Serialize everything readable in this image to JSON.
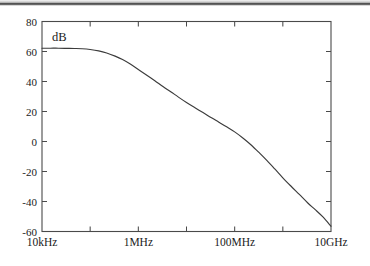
{
  "figure": {
    "background_color": "#ffffff",
    "line_color": "#3b3b3b",
    "axis_color": "#4a4a4a",
    "scan_artifact_label": "scan-band"
  },
  "chart_data": {
    "type": "line",
    "title": "",
    "subtitle": "",
    "xlabel": "",
    "ylabel": "dB",
    "ylabel_position": "inside-top-left",
    "x_scale": "log",
    "y_scale": "linear",
    "grid": false,
    "legend": null,
    "xlim": [
      10000,
      10000000000
    ],
    "ylim": [
      -60,
      80
    ],
    "x_tick_values": [
      10000,
      100000,
      1000000,
      10000000,
      100000000,
      1000000000,
      10000000000
    ],
    "x_tick_labels": [
      "10kHz",
      "",
      "1MHz",
      "",
      "100MHz",
      "",
      "10GHz"
    ],
    "x_major_labels": [
      {
        "value": 10000,
        "label": "10kHz"
      },
      {
        "value": 1000000,
        "label": "1MHz"
      },
      {
        "value": 100000000,
        "label": "100MHz"
      },
      {
        "value": 10000000000,
        "label": "10GHz"
      }
    ],
    "y_tick_values": [
      80,
      60,
      40,
      20,
      0,
      -20,
      -40,
      -60
    ],
    "y_tick_labels": [
      "80",
      "60",
      "40",
      "20",
      "0",
      "-20",
      "-40",
      "-60"
    ],
    "series": [
      {
        "name": "gain",
        "unit": "dB",
        "points": [
          {
            "x": 10000,
            "y": 62.2
          },
          {
            "x": 15000,
            "y": 62.2
          },
          {
            "x": 22000,
            "y": 62.2
          },
          {
            "x": 33000,
            "y": 62.1
          },
          {
            "x": 47000,
            "y": 62.0
          },
          {
            "x": 68000,
            "y": 61.8
          },
          {
            "x": 100000,
            "y": 61.3
          },
          {
            "x": 150000,
            "y": 60.4
          },
          {
            "x": 220000,
            "y": 59.0
          },
          {
            "x": 330000,
            "y": 56.9
          },
          {
            "x": 470000,
            "y": 54.6
          },
          {
            "x": 680000,
            "y": 51.6
          },
          {
            "x": 1000000,
            "y": 48.0
          },
          {
            "x": 1500000,
            "y": 44.2
          },
          {
            "x": 2200000,
            "y": 40.5
          },
          {
            "x": 3300000,
            "y": 36.5
          },
          {
            "x": 4700000,
            "y": 33.2
          },
          {
            "x": 6800000,
            "y": 29.6
          },
          {
            "x": 10000000,
            "y": 26.0
          },
          {
            "x": 15000000,
            "y": 22.5
          },
          {
            "x": 22000000,
            "y": 19.3
          },
          {
            "x": 33000000,
            "y": 15.8
          },
          {
            "x": 47000000,
            "y": 12.9
          },
          {
            "x": 68000000,
            "y": 9.8
          },
          {
            "x": 100000000,
            "y": 6.4
          },
          {
            "x": 150000000,
            "y": 2.2
          },
          {
            "x": 220000000,
            "y": -2.3
          },
          {
            "x": 330000000,
            "y": -7.8
          },
          {
            "x": 470000000,
            "y": -12.8
          },
          {
            "x": 680000000,
            "y": -18.3
          },
          {
            "x": 1000000000,
            "y": -24.2
          },
          {
            "x": 1500000000,
            "y": -30.0
          },
          {
            "x": 2200000000,
            "y": -35.3
          },
          {
            "x": 3300000000,
            "y": -41.0
          },
          {
            "x": 4700000000,
            "y": -45.4
          },
          {
            "x": 6800000000,
            "y": -50.3
          },
          {
            "x": 10000000000,
            "y": -56.5
          }
        ]
      }
    ],
    "annotations": [
      {
        "text": "dB",
        "x_px": 52,
        "y_px": 40,
        "role": "y-axis-unit"
      }
    ]
  }
}
